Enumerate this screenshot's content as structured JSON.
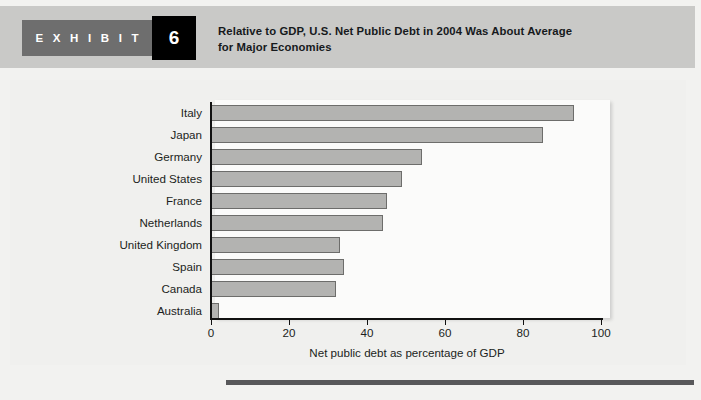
{
  "header": {
    "exhibit_tag": "E X H I B I T",
    "exhibit_number": "6",
    "title_line1": "Relative to GDP, U.S. Net Public Debt in 2004 Was About Average",
    "title_line2": "for Major Economies",
    "tag_block_color": "#6e6e6e",
    "number_block_color": "#000000",
    "band_color": "#c9c9c7"
  },
  "chart_data": {
    "type": "bar",
    "orientation": "horizontal",
    "title": "Relative to GDP, U.S. Net Public Debt in 2004 Was About Average for Major Economies",
    "xlabel": "Net public debt as percentage of GDP",
    "ylabel": "",
    "xlim": [
      0,
      100
    ],
    "xticks": [
      0,
      20,
      40,
      60,
      80,
      100
    ],
    "xtick_labels": [
      "0",
      "20",
      "40",
      "60",
      "80",
      "100"
    ],
    "grid": false,
    "legend": "none",
    "bar_fill_color": "#b3b3b1",
    "bar_border_color": "#6d6d6b",
    "plot_background": "#fbfbfa",
    "categories": [
      "Italy",
      "Japan",
      "Germany",
      "United States",
      "France",
      "Netherlands",
      "United Kingdom",
      "Spain",
      "Canada",
      "Australia"
    ],
    "values": [
      93,
      85,
      54,
      49,
      45,
      44,
      33,
      34,
      32,
      2
    ]
  },
  "axis_title": "Net public debt as percentage of GDP"
}
